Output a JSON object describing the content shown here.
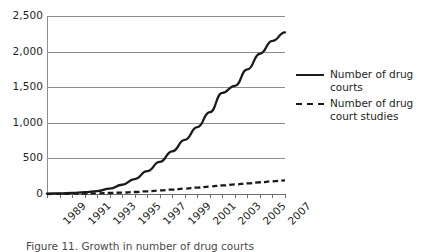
{
  "chart_data": {
    "type": "line",
    "title": "",
    "subtitle": "",
    "xlabel": "",
    "ylabel": "",
    "xlim": [
      1989,
      2008
    ],
    "ylim": [
      0,
      2500
    ],
    "grid": "horizontal",
    "legend_position": "right",
    "y_ticks": [
      "0",
      "500",
      "1,000",
      "1,500",
      "2,000",
      "2,500"
    ],
    "y_tick_values": [
      0,
      500,
      1000,
      1500,
      2000,
      2500
    ],
    "x_tick_labels": [
      "1989",
      "1991",
      "1993",
      "1995",
      "1997",
      "1999",
      "2001",
      "2003",
      "2005",
      "2007"
    ],
    "x": [
      1989,
      1990,
      1991,
      1992,
      1993,
      1994,
      1995,
      1996,
      1997,
      1998,
      1999,
      2000,
      2001,
      2002,
      2003,
      2004,
      2005,
      2006,
      2007,
      2008
    ],
    "series": [
      {
        "name": "Number of drug courts",
        "style": "solid",
        "color": "#1a1a1a",
        "values": [
          5,
          10,
          15,
          25,
          40,
          75,
          130,
          210,
          320,
          450,
          600,
          760,
          940,
          1150,
          1420,
          1520,
          1750,
          1970,
          2150,
          2270
        ]
      },
      {
        "name": "Number of drug court studies",
        "style": "dashed",
        "color": "#1a1a1a",
        "values": [
          0,
          2,
          4,
          6,
          9,
          14,
          20,
          28,
          38,
          50,
          62,
          75,
          90,
          105,
          120,
          135,
          150,
          165,
          178,
          190
        ]
      }
    ]
  },
  "legend": {
    "items": [
      {
        "label": "Number of drug courts",
        "style": "solid"
      },
      {
        "label": "Number of drug court studies",
        "style": "dashed"
      }
    ]
  },
  "caption": {
    "text": "Figure 11. Growth in number of drug courts"
  }
}
